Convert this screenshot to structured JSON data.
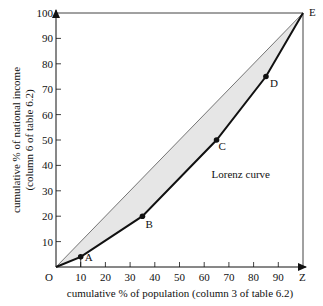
{
  "chart_data": {
    "type": "line",
    "title": "",
    "xlabel": "cumulative % of population (column 3 of table 6.2)",
    "ylabel_lines": [
      "cumulative % of national income",
      "(column 6 of table 6.2)"
    ],
    "xlim": [
      0,
      100
    ],
    "ylim": [
      0,
      100
    ],
    "x_ticks": [
      10,
      20,
      30,
      40,
      50,
      60,
      70,
      80,
      90
    ],
    "x_tick_labels": [
      "10",
      "20",
      "30",
      "40",
      "50",
      "60",
      "70",
      "80",
      "90"
    ],
    "y_ticks": [
      10,
      20,
      30,
      40,
      50,
      60,
      70,
      80,
      90,
      100
    ],
    "y_tick_labels": [
      "10",
      "20",
      "30",
      "40",
      "50",
      "60",
      "70",
      "80",
      "90",
      "100"
    ],
    "grid": false,
    "series": [
      {
        "name": "Lorenz curve",
        "style": "thick-black-with-markers",
        "points": [
          {
            "label": "O",
            "x": 0,
            "y": 0
          },
          {
            "label": "A",
            "x": 10,
            "y": 4
          },
          {
            "label": "B",
            "x": 35,
            "y": 20
          },
          {
            "label": "C",
            "x": 65,
            "y": 50
          },
          {
            "label": "D",
            "x": 85,
            "y": 75
          },
          {
            "label": "E",
            "x": 100,
            "y": 100
          }
        ]
      },
      {
        "name": "Line of equality",
        "style": "thin",
        "points": [
          {
            "label": "O",
            "x": 0,
            "y": 0
          },
          {
            "label": "E",
            "x": 100,
            "y": 100
          }
        ]
      }
    ],
    "corner_labels": {
      "origin": "O",
      "top_right": "E",
      "bottom_right": "Z"
    },
    "annotations": [
      {
        "text": "Lorenz curve",
        "x": 63,
        "y": 35
      }
    ],
    "shaded_area": "between line of equality and Lorenz curve",
    "colors": {
      "shade": "#e6e6e6",
      "line": "#111111"
    }
  }
}
